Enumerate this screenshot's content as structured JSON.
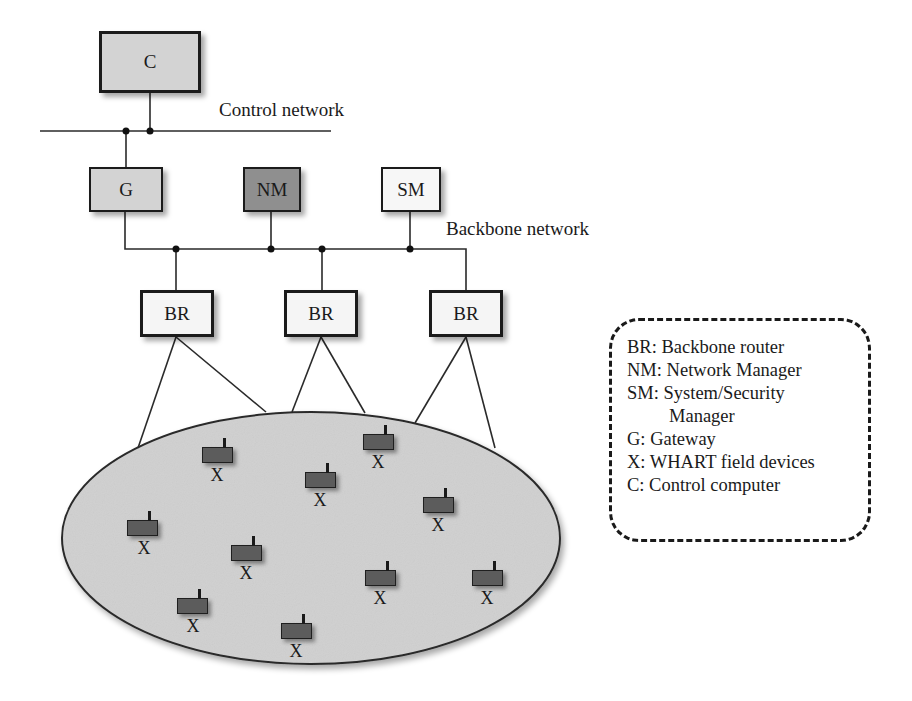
{
  "diagram": {
    "nodes": {
      "control_computer": {
        "label": "C",
        "fill": "#d3d3d3"
      },
      "gateway": {
        "label": "G",
        "fill": "#d3d3d3"
      },
      "network_manager": {
        "label": "NM",
        "fill": "#8f8f8f"
      },
      "security_manager": {
        "label": "SM",
        "fill": "#f7f7f7"
      },
      "backbone_routers": [
        {
          "label": "BR",
          "fill": "#f5f5f5"
        },
        {
          "label": "BR",
          "fill": "#f5f5f5"
        },
        {
          "label": "BR",
          "fill": "#f5f5f5"
        }
      ]
    },
    "networks": {
      "control": "Control network",
      "backbone": "Backbone network"
    },
    "field_area": {
      "fill": "#d0d0d0",
      "device_fill": "#5c5c5c",
      "devices": [
        {
          "label": "X"
        },
        {
          "label": "X"
        },
        {
          "label": "X"
        },
        {
          "label": "X"
        },
        {
          "label": "X"
        },
        {
          "label": "X"
        },
        {
          "label": "X"
        },
        {
          "label": "X"
        },
        {
          "label": "X"
        },
        {
          "label": "X"
        }
      ]
    }
  },
  "legend": {
    "items": [
      "BR: Backbone router",
      "NM: Network Manager",
      "SM: System/Security",
      "Manager",
      "G: Gateway",
      "X: WHART field devices",
      "C: Control computer"
    ]
  }
}
